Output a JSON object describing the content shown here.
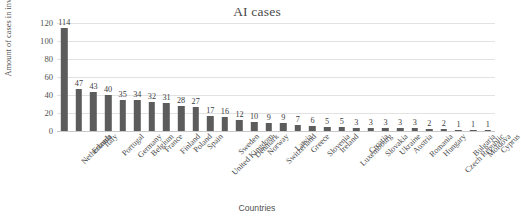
{
  "chart_data": {
    "type": "bar",
    "title": "AI cases",
    "xlabel": "Countries",
    "ylabel": "Amount of cases in inventory",
    "ylim": [
      0,
      120
    ],
    "yticks": [
      0,
      20,
      40,
      60,
      80,
      100,
      120
    ],
    "grid": true,
    "legend": null,
    "bar_color": "#5c5c5c",
    "gridline_color": "#e2e2e2",
    "show_value_labels": true,
    "categories": [
      "Netherlands",
      "Estonia",
      "Italy",
      "Portugal",
      "Germany",
      "Belgium",
      "France",
      "Finland",
      "Poland",
      "Spain",
      "United Kingdom",
      "Sweden",
      "Denmark",
      "Norway",
      "Switzerland",
      "Latvia",
      "Greece",
      "Slovenia",
      "Ireland",
      "Luxembourg",
      "Croatia",
      "Slovakia",
      "Ukraine",
      "Austria",
      "Romania",
      "Hungary",
      "Czech Republic",
      "Bulgaria",
      "Moldova",
      "Cyprus"
    ],
    "values": [
      114,
      47,
      43,
      40,
      35,
      34,
      32,
      31,
      28,
      27,
      17,
      16,
      12,
      10,
      9,
      9,
      7,
      6,
      5,
      5,
      3,
      3,
      3,
      3,
      3,
      2,
      2,
      1,
      1,
      1
    ]
  }
}
